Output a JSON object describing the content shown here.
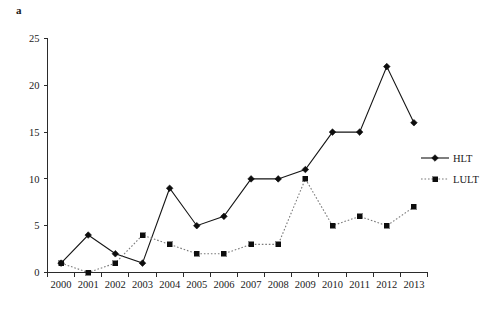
{
  "panel": {
    "label": "a"
  },
  "chart_data": {
    "type": "line",
    "title": "",
    "xlabel": "",
    "ylabel": "",
    "categories": [
      "2000",
      "2001",
      "2002",
      "2003",
      "2004",
      "2005",
      "2006",
      "2007",
      "2008",
      "2009",
      "2010",
      "2011",
      "2012",
      "2013"
    ],
    "series": [
      {
        "name": "HLT",
        "marker": "diamond",
        "linestyle": "solid",
        "color": "#0d0d0d",
        "values": [
          1,
          4,
          2,
          1,
          9,
          5,
          6,
          10,
          10,
          11,
          15,
          15,
          22,
          16
        ]
      },
      {
        "name": "LULT",
        "marker": "square",
        "linestyle": "dotted",
        "color": "#7a7a7a",
        "values": [
          1,
          0,
          1,
          4,
          3,
          2,
          2,
          3,
          3,
          10,
          5,
          6,
          5,
          7
        ]
      }
    ],
    "ylim": [
      0,
      25
    ],
    "yticks": [
      0,
      5,
      10,
      15,
      20,
      25
    ],
    "ytick_labels": [
      "0",
      "5",
      "10",
      "15",
      "20",
      "25"
    ],
    "grid": false,
    "legend_position": "right"
  },
  "legend": {
    "entries": [
      {
        "label": "HLT"
      },
      {
        "label": "LULT"
      }
    ]
  }
}
